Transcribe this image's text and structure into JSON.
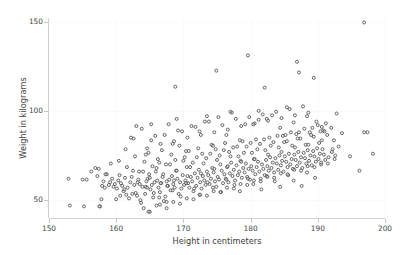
{
  "figure": {
    "width": 402,
    "height": 255,
    "background": "#ffffff"
  },
  "axes": {
    "x_title": "Height in centimeters",
    "y_title": "Weight in kilograms",
    "x_ticks": [
      "150",
      "160",
      "170",
      "180",
      "190",
      "200"
    ],
    "y_ticks": [
      "150",
      "100",
      "50"
    ],
    "spine_color": "#d2d2d2",
    "tick_label_color": "#474747",
    "grid_color": "#fafafa",
    "marker_edge_color": "#4d4d4d",
    "marker_face_color": "#ffffff"
  },
  "chart_data": {
    "type": "scatter",
    "title": "",
    "xlabel": "Height in centimeters",
    "ylabel": "Weight in kilograms",
    "xlim": [
      150,
      200
    ],
    "ylim": [
      40,
      152
    ],
    "xticks": [
      150,
      160,
      170,
      180,
      190,
      200
    ],
    "yticks": [
      50,
      100,
      150
    ],
    "grid": true,
    "legend": null,
    "n_points": 452,
    "marker": {
      "shape": "circle",
      "size": 3,
      "filled": false,
      "edge_color": "#4d4d4d"
    },
    "series": [
      {
        "name": "individuals",
        "x": [
          152.9,
          153.1,
          155.2,
          155.6,
          157.6,
          157.8,
          157.9,
          158.1,
          158.3,
          158.6,
          156.3,
          156.9,
          157.2,
          157.4,
          158.9,
          159.1,
          159.4,
          159.6,
          159.8,
          160.1,
          160.3,
          160.5,
          160.7,
          160.9,
          161.1,
          161.3,
          161.5,
          161.7,
          161.9,
          162.1,
          162.3,
          162.5,
          162.7,
          162.9,
          163.1,
          163.3,
          163.5,
          163.7,
          163.9,
          164.1,
          164.3,
          164.5,
          164.7,
          164.9,
          165.1,
          165.3,
          165.5,
          165.7,
          165.9,
          166.1,
          166.3,
          166.5,
          166.7,
          166.9,
          167.1,
          167.3,
          167.5,
          167.7,
          167.9,
          168.1,
          168.3,
          168.5,
          168.7,
          168.9,
          169.1,
          169.3,
          169.5,
          169.7,
          169.9,
          170.1,
          170.3,
          170.5,
          170.7,
          170.9,
          171.1,
          171.3,
          171.5,
          171.7,
          171.9,
          172.1,
          172.3,
          172.5,
          172.7,
          172.9,
          173.1,
          173.3,
          173.5,
          173.7,
          173.9,
          174.1,
          174.3,
          174.5,
          174.7,
          174.9,
          175.1,
          175.3,
          175.5,
          175.7,
          175.9,
          176.1,
          176.3,
          176.5,
          176.7,
          176.9,
          177.1,
          177.3,
          177.5,
          177.7,
          177.9,
          178.1,
          178.3,
          178.5,
          178.7,
          178.9,
          179.1,
          179.3,
          179.5,
          179.7,
          179.9,
          180.1,
          180.3,
          180.5,
          180.7,
          180.9,
          181.1,
          181.3,
          181.5,
          181.7,
          181.9,
          182.1,
          182.3,
          182.5,
          182.7,
          182.9,
          183.1,
          183.3,
          183.5,
          183.7,
          183.9,
          184.1,
          184.3,
          184.5,
          184.7,
          184.9,
          185.1,
          185.3,
          185.5,
          185.7,
          185.9,
          186.1,
          186.3,
          186.5,
          186.7,
          186.9,
          187.1,
          187.3,
          187.5,
          187.7,
          187.9,
          188.1,
          188.3,
          188.5,
          188.7,
          188.9,
          189.1,
          189.3,
          189.5,
          189.7,
          189.9,
          190.1,
          190.3,
          190.5,
          190.7,
          190.9,
          191.1,
          191.6,
          192.1,
          192.6,
          193.1,
          194.8,
          196.2,
          196.9,
          197.4,
          198.2,
          158.4,
          159.2,
          160.4,
          161.6,
          162.8,
          163.4,
          164.2,
          164.8,
          165.4,
          166.2,
          166.8,
          167.4,
          168.2,
          168.8,
          169.4,
          170.2,
          170.8,
          171.4,
          172.2,
          172.8,
          173.4,
          174.2,
          174.8,
          175.4,
          176.2,
          176.8,
          177.4,
          178.2,
          178.8,
          179.4,
          180.2,
          180.8,
          181.4,
          182.2,
          182.8,
          183.4,
          184.2,
          184.8,
          185.4,
          186.2,
          186.8,
          187.4,
          188.2,
          188.8,
          189.4,
          190.2,
          190.8,
          191.4,
          192.4,
          193.6,
          160.6,
          161.2,
          162.4,
          163.6,
          164.4,
          165.6,
          166.4,
          167.6,
          168.4,
          169.6,
          170.4,
          171.6,
          172.4,
          173.6,
          174.4,
          175.6,
          176.4,
          177.6,
          178.4,
          179.6,
          180.4,
          181.6,
          182.4,
          183.6,
          184.4,
          185.6,
          186.4,
          187.6,
          188.4,
          189.6,
          161.4,
          162.6,
          163.8,
          164.6,
          165.8,
          166.6,
          167.8,
          168.6,
          169.8,
          170.6,
          171.8,
          172.6,
          173.8,
          174.6,
          175.8,
          176.6,
          177.8,
          178.6,
          179.8,
          180.6,
          181.8,
          182.6,
          183.8,
          184.6,
          185.8,
          186.6,
          187.8,
          188.6,
          189.8,
          190.6,
          163.2,
          164.0,
          165.0,
          166.0,
          167.0,
          168.0,
          169.0,
          170.0,
          171.0,
          172.0,
          173.0,
          174.0,
          175.0,
          176.0,
          177.0,
          178.0,
          179.0,
          180.0,
          181.0,
          182.0,
          183.0,
          184.0,
          185.0,
          186.0,
          187.0,
          188.0,
          189.0,
          190.0,
          191.0,
          192.0,
          162.2,
          163.0,
          164.6,
          165.2,
          166.6,
          167.2,
          168.6,
          169.2,
          170.6,
          171.2,
          172.6,
          173.2,
          174.6,
          175.2,
          176.6,
          177.2,
          178.6,
          179.2,
          180.6,
          181.2,
          182.6,
          183.2,
          184.6,
          185.2,
          186.6,
          187.2,
          188.6,
          189.2,
          190.6,
          191.2,
          165.0,
          166.5,
          167.5,
          168.5,
          169.5,
          170.5,
          171.5,
          172.5,
          173.5,
          174.5,
          175.5,
          176.5,
          177.5,
          178.5,
          179.5,
          180.5,
          181.5,
          182.5,
          183.5,
          184.5,
          185.5,
          186.5,
          187.5,
          188.5,
          189.5,
          190.5,
          191.5,
          192.5,
          164.4,
          166.4,
          168.4,
          170.4,
          172.4,
          174.4,
          176.4,
          178.4,
          180.4,
          182.4,
          184.4,
          186.4,
          188.4,
          190.4,
          192.2,
          168.8,
          174.9,
          179.6,
          182.1,
          186.9,
          187.2,
          189.4,
          192.8,
          196.9,
          165.2,
          169.0,
          173.5,
          177.0,
          181.2,
          185.4,
          155.0,
          157.5,
          160.0,
          164.8,
          166.0,
          167.5
        ],
        "y": [
          62.0,
          47.0,
          46.5,
          61.5,
          46.5,
          50.5,
          58.0,
          60.5,
          57.0,
          64.5,
          66.0,
          68.0,
          63.5,
          67.5,
          58.5,
          60.0,
          62.0,
          57.5,
          59.0,
          56.5,
          61.0,
          64.0,
          59.5,
          58.0,
          55.0,
          62.5,
          53.0,
          57.0,
          51.0,
          60.0,
          63.0,
          66.5,
          58.5,
          54.0,
          52.5,
          61.5,
          59.0,
          48.5,
          57.5,
          45.5,
          53.5,
          60.5,
          62.0,
          64.5,
          56.0,
          58.5,
          51.5,
          60.0,
          66.0,
          61.0,
          57.0,
          54.5,
          59.5,
          63.0,
          49.5,
          52.0,
          60.5,
          58.0,
          61.5,
          55.5,
          63.5,
          59.0,
          57.0,
          66.5,
          62.0,
          53.5,
          60.0,
          56.5,
          64.0,
          58.5,
          61.0,
          68.5,
          59.5,
          57.0,
          63.0,
          60.5,
          55.0,
          65.0,
          58.0,
          62.5,
          67.0,
          60.0,
          56.5,
          63.5,
          61.0,
          58.5,
          66.0,
          64.0,
          59.0,
          62.0,
          68.0,
          65.5,
          60.5,
          57.5,
          63.0,
          61.5,
          70.0,
          66.5,
          59.5,
          64.5,
          62.0,
          68.5,
          60.0,
          65.0,
          71.0,
          63.5,
          67.0,
          61.0,
          69.5,
          64.0,
          66.0,
          72.0,
          62.5,
          68.0,
          65.5,
          70.5,
          63.0,
          67.5,
          61.5,
          69.0,
          66.5,
          73.0,
          64.5,
          68.5,
          71.5,
          66.0,
          62.0,
          70.0,
          67.5,
          64.0,
          72.5,
          69.0,
          66.5,
          74.0,
          68.0,
          71.0,
          65.5,
          73.5,
          70.5,
          67.0,
          75.0,
          69.5,
          72.0,
          66.0,
          74.5,
          71.5,
          68.5,
          76.0,
          70.0,
          73.0,
          67.5,
          75.5,
          72.5,
          69.0,
          77.0,
          71.0,
          74.0,
          68.0,
          76.5,
          73.5,
          70.5,
          78.0,
          72.0,
          75.0,
          69.5,
          77.5,
          74.5,
          71.5,
          79.0,
          73.0,
          76.0,
          70.0,
          78.5,
          75.5,
          72.5,
          74.0,
          77.0,
          75.0,
          80.0,
          74.5,
          66.5,
          149.5,
          88.0,
          76.0,
          64.5,
          70.5,
          72.0,
          68.5,
          74.5,
          66.0,
          71.5,
          76.5,
          69.0,
          73.0,
          78.0,
          70.0,
          75.5,
          72.5,
          80.5,
          74.0,
          77.5,
          71.0,
          79.0,
          76.0,
          73.5,
          81.0,
          78.5,
          75.0,
          82.0,
          77.0,
          79.5,
          74.5,
          83.0,
          80.0,
          76.5,
          84.0,
          81.5,
          78.0,
          85.0,
          82.5,
          79.5,
          86.0,
          83.0,
          80.5,
          87.0,
          84.5,
          81.0,
          88.0,
          85.5,
          82.0,
          89.0,
          86.5,
          83.5,
          87.5,
          52.5,
          56.0,
          53.5,
          50.0,
          57.5,
          54.0,
          51.5,
          58.0,
          55.5,
          52.0,
          59.5,
          56.5,
          53.0,
          60.0,
          57.0,
          54.5,
          61.5,
          58.5,
          55.0,
          62.0,
          59.0,
          56.0,
          63.5,
          60.5,
          57.5,
          64.0,
          61.0,
          58.0,
          65.5,
          62.5,
          78.5,
          84.5,
          90.0,
          79.0,
          86.0,
          81.5,
          92.5,
          83.0,
          88.5,
          85.0,
          91.0,
          86.5,
          94.0,
          88.0,
          92.0,
          89.5,
          95.5,
          91.5,
          96.5,
          93.0,
          98.0,
          94.5,
          99.5,
          96.0,
          101.0,
          97.5,
          102.5,
          99.0,
          94.0,
          91.0,
          60.0,
          66.0,
          62.5,
          68.0,
          64.5,
          70.0,
          66.5,
          72.0,
          68.5,
          74.0,
          70.5,
          76.0,
          72.5,
          78.0,
          74.5,
          80.0,
          76.5,
          82.0,
          78.5,
          84.0,
          80.5,
          86.0,
          82.5,
          88.0,
          84.5,
          90.0,
          86.5,
          92.0,
          88.5,
          90.5,
          85.0,
          91.5,
          57.0,
          83.5,
          59.5,
          86.5,
          61.0,
          89.0,
          63.5,
          91.5,
          65.0,
          94.0,
          67.5,
          96.5,
          69.0,
          99.0,
          71.5,
          92.5,
          73.0,
          95.0,
          75.5,
          97.5,
          77.0,
          86.5,
          79.5,
          88.0,
          81.0,
          90.5,
          83.5,
          93.0,
          43.5,
          47.5,
          45.5,
          49.0,
          48.0,
          51.0,
          50.5,
          53.0,
          52.5,
          55.0,
          54.5,
          57.0,
          56.5,
          59.0,
          58.5,
          61.0,
          60.5,
          63.0,
          62.5,
          65.0,
          64.5,
          67.0,
          66.5,
          69.0,
          68.5,
          71.0,
          70.5,
          73.0,
          75.5,
          71.0,
          81.5,
          77.5,
          88.5,
          80.5,
          86.5,
          83.5,
          92.5,
          95.5,
          90.5,
          93.5,
          97.0,
          88.5,
          78.5,
          113.5,
          122.5,
          131.0,
          113.0,
          127.5,
          121.5,
          118.5,
          98.5,
          88.0,
          92.5,
          95.5,
          97.0,
          99.5,
          100.0,
          102.0,
          61.5,
          46.5,
          50.5,
          43.5,
          47.0,
          49.0
        ]
      }
    ]
  }
}
